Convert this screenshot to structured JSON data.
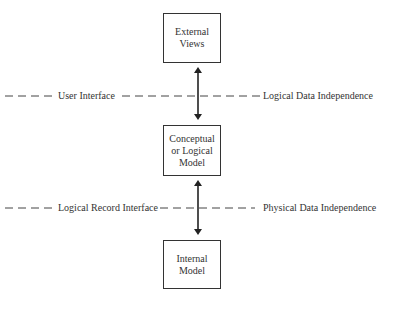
{
  "diagram": {
    "type": "three-level-architecture",
    "boxes": {
      "external": {
        "lines": [
          "External",
          "Views"
        ]
      },
      "conceptual": {
        "lines": [
          "Conceptual",
          "or Logical",
          "Model"
        ]
      },
      "internal": {
        "lines": [
          "Internal",
          "Model"
        ]
      }
    },
    "interfaces": {
      "upper": {
        "left_label": "User Interface",
        "right_label": "Logical Data Independence"
      },
      "lower": {
        "left_label": "Logical Record Interface",
        "right_label": "Physical Data Independence"
      }
    },
    "connectors": [
      {
        "from": "External Views",
        "to": "Conceptual or Logical Model",
        "style": "double-arrow"
      },
      {
        "from": "Conceptual or Logical Model",
        "to": "Internal Model",
        "style": "double-arrow"
      }
    ],
    "colors": {
      "line": "#333333",
      "background": "#ffffff"
    }
  }
}
